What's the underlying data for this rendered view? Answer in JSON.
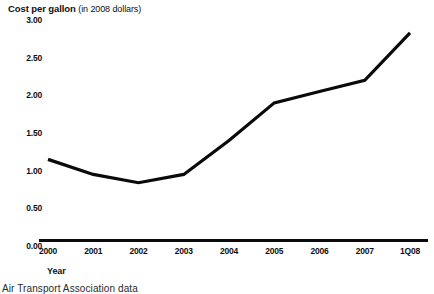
{
  "chart_data": {
    "type": "line",
    "title": "Cost per gallon (in 2008 dollars)",
    "title_strong": "Cost per gallon",
    "title_paren": "(in 2008 dollars)",
    "xlabel": "Year",
    "ylabel": "",
    "categories": [
      "2000",
      "2001",
      "2002",
      "2003",
      "2004",
      "2005",
      "2006",
      "2007",
      "1Q08"
    ],
    "values": [
      1.15,
      0.95,
      0.84,
      0.95,
      1.4,
      1.9,
      2.05,
      2.2,
      2.83
    ],
    "series": [
      {
        "name": "Cost per gallon",
        "values": [
          1.15,
          0.95,
          0.84,
          0.95,
          1.4,
          1.9,
          2.05,
          2.2,
          2.83
        ]
      }
    ],
    "ylim": [
      0.0,
      3.0
    ],
    "ytick_labels": [
      "3.00",
      "2.50",
      "2.00",
      "1.50",
      "1.00",
      "0.50",
      "0.00"
    ],
    "ytick_values": [
      3.0,
      2.5,
      2.0,
      1.5,
      1.0,
      0.5,
      0.0
    ],
    "xtick_labels": [
      "2000",
      "2001",
      "2002",
      "2003",
      "2004",
      "2005",
      "2006",
      "2007",
      "1Q08"
    ],
    "grid": false,
    "legend": false,
    "line_color": "#0a0a0a",
    "axis_color": "#0a0a0a",
    "background": "#ffffff"
  },
  "source": {
    "text": "Air Transport Association data"
  }
}
